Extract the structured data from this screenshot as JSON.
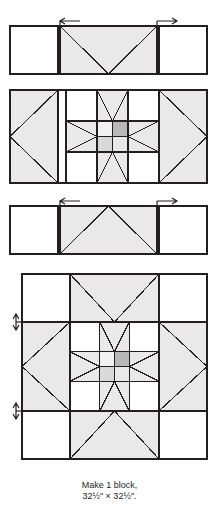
{
  "diagram": {
    "type": "quilt-block-assembly",
    "caption_line1": "Make 1 block,",
    "caption_line2": "32½\" × 32½\".",
    "colors": {
      "background": "#ffffff",
      "outline": "#231f20",
      "light": "#ffffff",
      "light_gray": "#e9e9e9",
      "medium_gray": "#d9d9d9",
      "dark_gray": "#b8b8b8",
      "pale_gray": "#f2f2f2",
      "arrow": "#231f20"
    },
    "stages": [
      {
        "name": "top-row",
        "label": "top row: square, flying-geese unit, square",
        "units": [
          {
            "name": "plain-square-left",
            "fill": "light"
          },
          {
            "name": "flying-geese-down",
            "fill": "light_gray"
          },
          {
            "name": "plain-square-right",
            "fill": "light"
          }
        ],
        "arrows": [
          {
            "name": "seam-arrow-left",
            "direction": "left"
          },
          {
            "name": "seam-arrow-right",
            "direction": "right"
          }
        ]
      },
      {
        "name": "middle-row",
        "label": "middle row: star block with side flying-geese",
        "units": [
          {
            "name": "flying-geese-left",
            "fill": "light_gray"
          },
          {
            "name": "star-block-center",
            "fill": "mixed"
          },
          {
            "name": "flying-geese-right",
            "fill": "light_gray"
          }
        ],
        "arrows": []
      },
      {
        "name": "bottom-row",
        "label": "bottom row: square, flying-geese unit, square",
        "units": [
          {
            "name": "plain-square-left",
            "fill": "light"
          },
          {
            "name": "flying-geese-up",
            "fill": "light_gray"
          },
          {
            "name": "plain-square-right",
            "fill": "light"
          }
        ],
        "arrows": [
          {
            "name": "seam-arrow-left",
            "direction": "left"
          },
          {
            "name": "seam-arrow-right",
            "direction": "right"
          }
        ]
      },
      {
        "name": "assembled-block",
        "label": "finished pieced block",
        "units": [
          {
            "name": "outer-star-points",
            "fill": "light_gray"
          },
          {
            "name": "inner-star-block",
            "fill": "mixed"
          },
          {
            "name": "center-four-patch",
            "fill": "mixed"
          }
        ],
        "arrows": [
          {
            "name": "seam-arrow-upper-left",
            "direction": "vertical"
          },
          {
            "name": "seam-arrow-lower-left",
            "direction": "vertical"
          }
        ]
      }
    ]
  }
}
